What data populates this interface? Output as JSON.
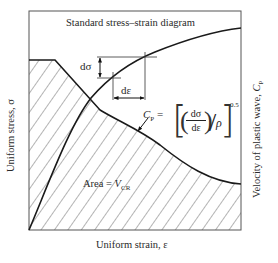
{
  "figure": {
    "title": "Standard stress–strain diagram",
    "x_axis_label": "Uniform strain, ε",
    "y_axis_label": "Uniform stress, σ",
    "y2_axis_label_main": "Velocity of plastic wave, ",
    "y2_axis_symbol": "C",
    "y2_axis_subscript": "P",
    "annotations": {
      "d_sigma": "dσ",
      "d_epsilon": "dε",
      "cp_label_symbol": "C",
      "cp_label_subscript": "P",
      "cp_equals": " =",
      "equation_numerator": "dσ",
      "equation_denominator": "dε",
      "equation_rho": "ρ",
      "equation_exponent": "0.5",
      "area_text": "Area = ",
      "area_symbol": "V",
      "area_subscript": "CR"
    },
    "colors": {
      "line": "#1a1a1a",
      "frame": "#555555",
      "hatch": "#444444",
      "background": "#ffffff"
    }
  }
}
